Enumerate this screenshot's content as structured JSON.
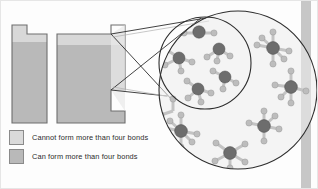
{
  "figure": {
    "background_color": "#fdfdfd",
    "border_color": "#e6e6e6"
  },
  "colors": {
    "bar_light": "#d8d8d8",
    "bar_dark": "#b9b9b9",
    "bar_outline": "#6e6e6e",
    "inset_fill": "#e2e2e2",
    "circle_stroke": "#2d2d2d",
    "connector_stroke": "#2d2d2d",
    "atom_center": "#6d6d6d",
    "atom_outer": "#bdbdbd",
    "bond": "#c3c3c3",
    "right_edge_bar": "#bdbdbd",
    "text": "#2b2b2b"
  },
  "bars": {
    "left_bar": {
      "name": "cannot-form-more-than-four-bonds-bar",
      "notch_side": "top-left",
      "fill_top": "#d8d8d8",
      "fill_body": "#b9b9b9"
    },
    "right_bar": {
      "name": "can-form-more-than-four-bonds-bar",
      "notch_side": "top-right",
      "fill_top": "#d8d8d8",
      "fill_body": "#b9b9b9"
    }
  },
  "legend": {
    "items": [
      {
        "label": "Cannot form more than four bonds",
        "swatch_color": "#dadada",
        "swatch_border": "#8a8a8a"
      },
      {
        "label": "Can form more than four bonds",
        "swatch_color": "#b9b9b9",
        "swatch_border": "#8a8a8a"
      }
    ]
  },
  "inset": {
    "name": "magnifier-callout",
    "outer_circle": {
      "cx": 237,
      "cy": 89,
      "r": 79
    },
    "inner_circle": {
      "cx": 204,
      "cy": 62,
      "r": 46
    },
    "connector_lines": 4,
    "inner_molecules": [
      {
        "type": "linear",
        "bonds": 2,
        "note": "two bonds, straight"
      },
      {
        "type": "tetrahedral",
        "bonds": 4
      },
      {
        "type": "trigonal",
        "bonds": 3
      },
      {
        "type": "bent",
        "bonds": 3
      },
      {
        "type": "tetrahedral",
        "bonds": 4
      }
    ],
    "outer_molecules": [
      {
        "type": "octahedral",
        "bonds": 6
      },
      {
        "type": "trigonal-bipyramidal",
        "bonds": 5
      },
      {
        "type": "octahedral",
        "bonds": 6
      },
      {
        "type": "trigonal-bipyramidal",
        "bonds": 5
      },
      {
        "type": "trigonal-bipyramidal",
        "bonds": 5
      },
      {
        "type": "tetrahedral-plus",
        "bonds": 5
      }
    ]
  }
}
